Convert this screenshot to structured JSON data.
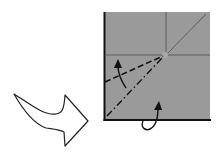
{
  "diagram": {
    "type": "origami-fold-step",
    "background": "#ffffff",
    "paper": {
      "x": 104,
      "y": 12,
      "width": 106,
      "height": 108,
      "fill": "#9a9a9a",
      "edge_color": "#111111"
    },
    "existing_creases": {
      "color": "#5e5e5e",
      "horizontal": {
        "x1": 104,
        "y1": 55,
        "x2": 210,
        "y2": 55
      },
      "vertical": {
        "x1": 166,
        "y1": 12,
        "x2": 166,
        "y2": 55
      },
      "diagonal": {
        "x1": 166,
        "y1": 55,
        "x2": 206,
        "y2": 14
      }
    },
    "fold_lines": {
      "valley_fold": {
        "style": "dashed",
        "x1": 105,
        "y1": 82,
        "x2": 163,
        "y2": 56
      },
      "mountain_fold": {
        "style": "dash-dot",
        "x1": 107,
        "y1": 116,
        "x2": 163,
        "y2": 57
      }
    },
    "arrows": {
      "valley_arrow": {
        "meaning": "fold up",
        "head_x": 118,
        "head_y": 61
      },
      "mountain_arrow": {
        "meaning": "fold behind",
        "head_x": 158,
        "head_y": 102
      }
    },
    "next_step_arrow": {
      "meaning": "proceed to next step",
      "style": "hollow outline",
      "stroke": "#222222",
      "fill": "#ffffff"
    }
  }
}
